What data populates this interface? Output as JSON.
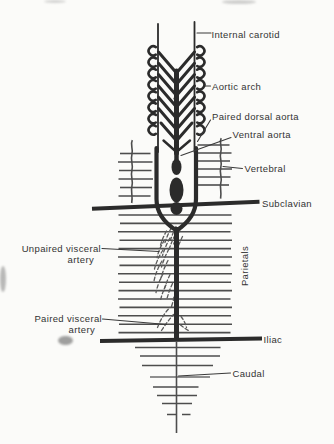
{
  "labels": {
    "internal_carotid": "Internal carotid",
    "aortic_arch": "Aortic arch",
    "paired_dorsal_aorta": "Paired dorsal aorta",
    "ventral_aorta": "Ventral aorta",
    "vertebral": "Vertebral",
    "subclavian": "Subclavian",
    "unpaired_visceral_line1": "Unpaired visceral",
    "unpaired_visceral_line2": "artery",
    "parietals": "Parietals",
    "paired_visceral_line1": "Paired visceral",
    "paired_visceral_line2": "artery",
    "iliac": "Iliac",
    "caudal": "Caudal"
  },
  "colors": {
    "ink": "#2b2b2b",
    "line-gray": "#4d4d4d",
    "hatch": "#5a5a5a",
    "label": "#333333",
    "leader": "#3a3a3a",
    "background": "#fbfbf9"
  }
}
